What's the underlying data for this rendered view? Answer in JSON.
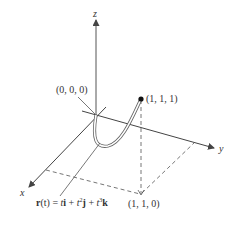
{
  "figure": {
    "type": "3d-space-curve",
    "axes": {
      "x_label": "x",
      "y_label": "y",
      "z_label": "z"
    },
    "points": {
      "origin_label": "(0, 0, 0)",
      "endpoint_label": "(1, 1, 1)",
      "projection_label": "(1, 1, 0)"
    },
    "curve": {
      "formula_parts": {
        "r": "r",
        "t_arg": "(t)",
        "eq": " = ",
        "t1": "t",
        "i": "i",
        "plus1": " + ",
        "t2": "t",
        "exp2": "2",
        "j": "j",
        "plus2": " + ",
        "t3": "t",
        "exp3": "3",
        "k": "k"
      },
      "formula_text": "r(t) = ti + t²j + t³k"
    },
    "colors": {
      "axis": "#444444",
      "curve": "#555555",
      "dashed": "#666666",
      "point": "#111111"
    }
  }
}
